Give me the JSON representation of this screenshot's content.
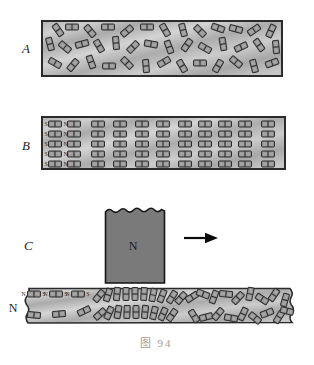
{
  "figure": {
    "caption": "图 94"
  },
  "colors": {
    "background": "#ffffff",
    "bar_stroke": "#2b2b2b",
    "domain_fill": "#8f8f8f",
    "domain_inner": "#bcbcbc",
    "domain_stroke": "#2d2d2d",
    "magnet_fill": "#7a7a7a",
    "magnet_stroke": "#151515",
    "arrow": "#0b0b0b",
    "label": "#1c1c1c",
    "caption": "#a79d8f"
  },
  "panels": {
    "a": {
      "label": "A",
      "domains": [
        [
          58,
          30,
          55
        ],
        [
          72,
          27,
          0
        ],
        [
          90,
          31,
          50
        ],
        [
          108,
          27,
          0
        ],
        [
          127,
          31,
          -40
        ],
        [
          147,
          27,
          0
        ],
        [
          165,
          30,
          60
        ],
        [
          183,
          30,
          75
        ],
        [
          200,
          31,
          45
        ],
        [
          218,
          28,
          20
        ],
        [
          236,
          29,
          15
        ],
        [
          254,
          30,
          -35
        ],
        [
          271,
          31,
          -65
        ],
        [
          50,
          44,
          75
        ],
        [
          65,
          47,
          40
        ],
        [
          82,
          44,
          -15
        ],
        [
          99,
          46,
          60
        ],
        [
          116,
          43,
          85
        ],
        [
          133,
          47,
          -45
        ],
        [
          151,
          44,
          10
        ],
        [
          169,
          47,
          70
        ],
        [
          187,
          45,
          -55
        ],
        [
          205,
          48,
          30
        ],
        [
          223,
          44,
          80
        ],
        [
          241,
          47,
          -25
        ],
        [
          259,
          45,
          55
        ],
        [
          276,
          47,
          85
        ],
        [
          55,
          63,
          30
        ],
        [
          73,
          65,
          -50
        ],
        [
          91,
          62,
          70
        ],
        [
          109,
          66,
          0
        ],
        [
          127,
          63,
          45
        ],
        [
          146,
          66,
          85
        ],
        [
          164,
          62,
          -30
        ],
        [
          182,
          66,
          60
        ],
        [
          200,
          63,
          0
        ],
        [
          218,
          66,
          -60
        ],
        [
          236,
          62,
          40
        ],
        [
          254,
          66,
          75
        ],
        [
          272,
          63,
          -20
        ]
      ]
    },
    "b": {
      "label": "B",
      "pole_left": "S",
      "pole_right": "N",
      "pole_left_x": 46,
      "pole_right_x": 65.5,
      "rows_cy": [
        124,
        134,
        144,
        154,
        164
      ],
      "cols_cx": [
        55,
        74,
        98,
        120,
        142,
        163,
        185,
        205,
        225,
        245,
        268
      ]
    },
    "c": {
      "label": "C",
      "magnet_label": "N",
      "outside_label": "N",
      "labeled_domains": [
        {
          "cx": 34,
          "cy": 294,
          "left": "N",
          "right": "S"
        },
        {
          "cx": 56,
          "cy": 294,
          "left": "N",
          "right": "S"
        },
        {
          "cx": 78,
          "cy": 294,
          "left": "N",
          "right": "S"
        }
      ],
      "domains": [
        [
          34,
          315,
          5
        ],
        [
          59,
          314,
          -5
        ],
        [
          84,
          311,
          -25
        ],
        [
          99,
          296,
          -50
        ],
        [
          108,
          295,
          -72
        ],
        [
          117,
          294,
          -84
        ],
        [
          126,
          294,
          -90
        ],
        [
          135,
          294,
          -90
        ],
        [
          144,
          294,
          -86
        ],
        [
          153,
          295,
          -78
        ],
        [
          162,
          296,
          -68
        ],
        [
          172,
          297,
          -58
        ],
        [
          181,
          298,
          -48
        ],
        [
          100,
          314,
          -42
        ],
        [
          109,
          313,
          -66
        ],
        [
          118,
          312,
          -80
        ],
        [
          127,
          312,
          -88
        ],
        [
          136,
          312,
          -90
        ],
        [
          145,
          312,
          -84
        ],
        [
          154,
          313,
          -76
        ],
        [
          163,
          314,
          -66
        ],
        [
          172,
          315,
          -54
        ],
        [
          192,
          297,
          -32
        ],
        [
          203,
          294,
          22
        ],
        [
          214,
          297,
          -70
        ],
        [
          226,
          294,
          6
        ],
        [
          238,
          298,
          -46
        ],
        [
          250,
          294,
          -78
        ],
        [
          262,
          299,
          32
        ],
        [
          274,
          295,
          -56
        ],
        [
          285,
          300,
          -74
        ],
        [
          194,
          316,
          58
        ],
        [
          206,
          317,
          -14
        ],
        [
          218,
          314,
          -50
        ],
        [
          231,
          318,
          10
        ],
        [
          243,
          314,
          -64
        ],
        [
          255,
          318,
          40
        ],
        [
          267,
          313,
          -22
        ],
        [
          279,
          317,
          -58
        ],
        [
          287,
          311,
          14
        ]
      ]
    }
  }
}
